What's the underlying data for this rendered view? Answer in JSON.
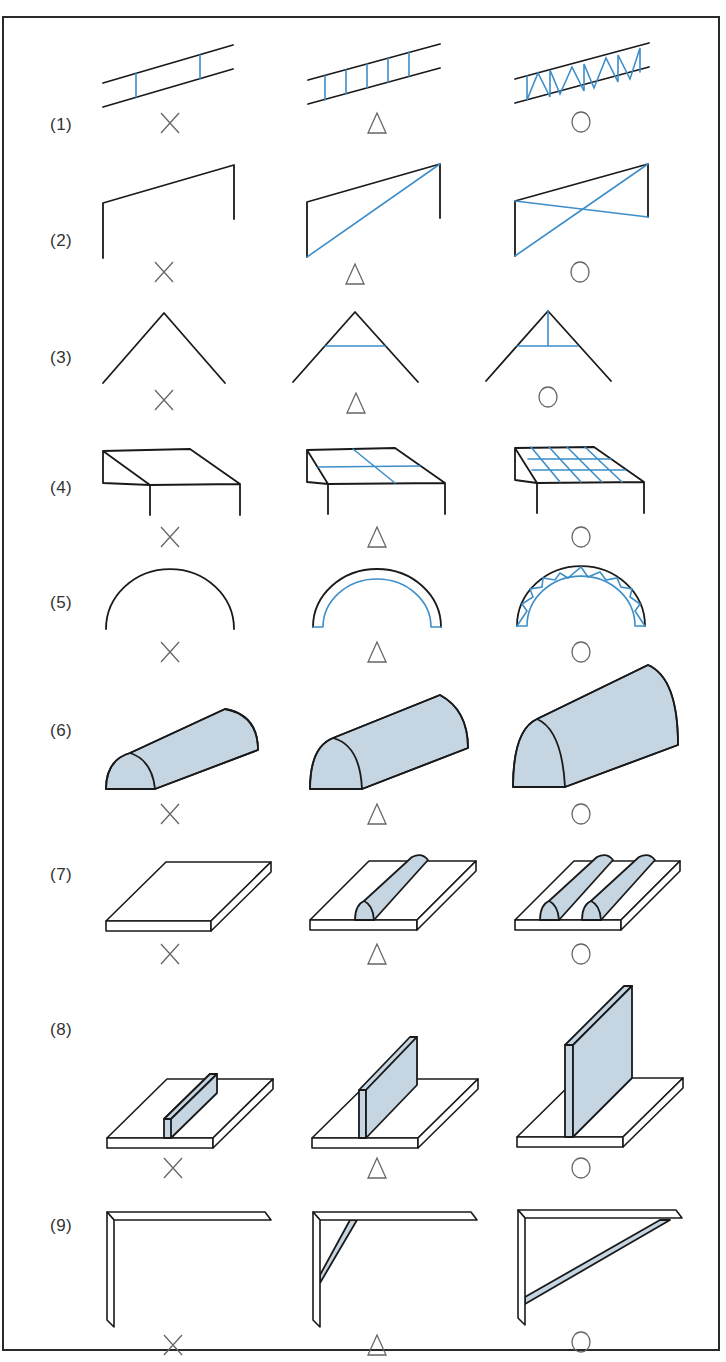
{
  "figure": {
    "rows": [
      {
        "label": "(1)",
        "subject": "parallel-beam lattice",
        "y": 127
      },
      {
        "label": "(2)",
        "subject": "portal frame bracing",
        "y": 243
      },
      {
        "label": "(3)",
        "subject": "gable roof tie",
        "y": 360
      },
      {
        "label": "(4)",
        "subject": "slab with grid beams",
        "y": 490
      },
      {
        "label": "(5)",
        "subject": "arch",
        "y": 605
      },
      {
        "label": "(6)",
        "subject": "half-cylinder vault",
        "y": 733
      },
      {
        "label": "(7)",
        "subject": "plate with ribs",
        "y": 877
      },
      {
        "label": "(8)",
        "subject": "plate with vertical web",
        "y": 1032
      },
      {
        "label": "(9)",
        "subject": "cantilever bracket",
        "y": 1228
      }
    ],
    "ratings": {
      "columns": [
        "×",
        "△",
        "○"
      ],
      "meaning": [
        "poor",
        "fair",
        "good"
      ]
    },
    "colors": {
      "line": "#1a1a1a",
      "accent_blue": "#3d8ec9",
      "fill_blue": "#c5d5e2",
      "frame": "#2a2a2a"
    }
  }
}
